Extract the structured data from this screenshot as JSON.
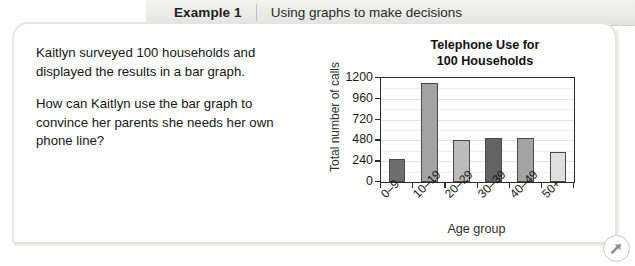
{
  "header": {
    "example_label": "Example 1",
    "example_title": "Using graphs to make decisions"
  },
  "body": {
    "paragraph_1": "Kaitlyn surveyed 100 households and displayed the results in a bar graph.",
    "paragraph_2": "How can Kaitlyn use the bar graph to convince her parents she needs her own phone line?"
  },
  "corner": {
    "badge_icon": "arrow-up-right-icon"
  },
  "colors": {
    "header_bg": "#ebebe8",
    "card_border": "#e4e4e2",
    "axis": "#2b2b2b",
    "gridline": "#e3e3e3",
    "text": "#161616"
  },
  "chart_data": {
    "type": "bar",
    "title": "Telephone Use for 100 Households",
    "title_line_1": "Telephone Use for",
    "title_line_2": "100 Households",
    "xlabel": "Age group",
    "ylabel": "Total number of calls",
    "categories": [
      "0–9",
      "10–19",
      "20–29",
      "30–39",
      "40–49",
      "50+"
    ],
    "values": [
      260,
      1140,
      490,
      510,
      510,
      350
    ],
    "bar_colors": [
      "#6e6e6e",
      "#a3a3a3",
      "#bcbcbc",
      "#636363",
      "#a3a3a3",
      "#dedede"
    ],
    "ylim": [
      0,
      1200
    ],
    "yticks": [
      0,
      240,
      480,
      720,
      960,
      1200
    ],
    "ytick_labels": [
      "0",
      "240",
      "480",
      "720",
      "960",
      "1200"
    ],
    "grid": true,
    "legend": "none"
  }
}
